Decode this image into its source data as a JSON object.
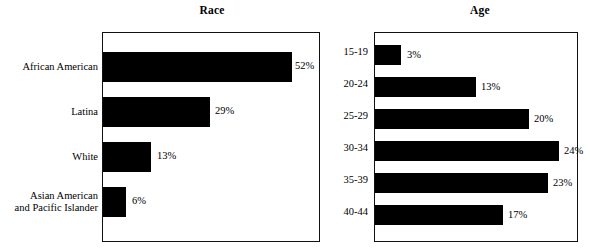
{
  "chart_data": [
    {
      "type": "bar",
      "title": "Race",
      "orientation": "horizontal",
      "xlabel": "",
      "ylabel": "",
      "xlim": [
        0,
        58
      ],
      "grid": false,
      "legend": "none",
      "categories": [
        "African American",
        "Latina",
        "White",
        "Asian American and Pacific Islander"
      ],
      "category_lines": [
        [
          "African American"
        ],
        [
          "Latina"
        ],
        [
          "White"
        ],
        [
          "Asian American",
          "and Pacific Islander"
        ]
      ],
      "values": [
        52,
        29,
        13,
        6
      ],
      "value_labels": [
        "52%",
        "29%",
        "13%",
        "6%"
      ]
    },
    {
      "type": "bar",
      "title": "Age",
      "orientation": "horizontal",
      "xlabel": "",
      "ylabel": "",
      "xlim": [
        0,
        26
      ],
      "grid": false,
      "legend": "none",
      "categories": [
        "15-19",
        "20-24",
        "25-29",
        "30-34",
        "35-39",
        "40-44"
      ],
      "category_lines": [
        [
          "15-19"
        ],
        [
          "20-24"
        ],
        [
          "25-29"
        ],
        [
          "30-34"
        ],
        [
          "35-39"
        ],
        [
          "40-44"
        ]
      ],
      "values": [
        3,
        13,
        20,
        24,
        23,
        17
      ],
      "value_labels": [
        "3%",
        "13%",
        "20%",
        "24%",
        "23%",
        "17%"
      ]
    }
  ],
  "style": {
    "bar_color": "#000000",
    "plot_background": "#ffffff",
    "axis_color": "#111111",
    "text_color": "#000000"
  }
}
